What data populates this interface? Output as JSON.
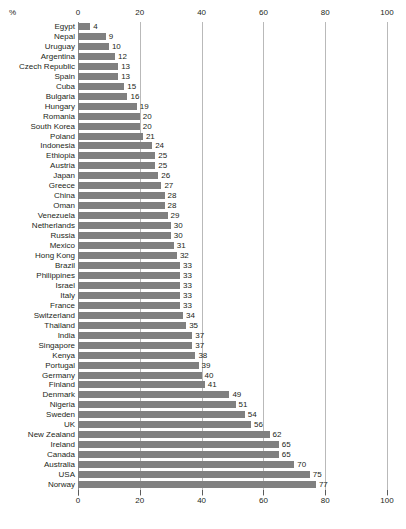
{
  "chart_data": {
    "type": "bar",
    "orientation": "horizontal",
    "title": "",
    "subtitle": "",
    "xlabel": "",
    "ylabel": "",
    "unit_label": "%",
    "xlim": [
      0,
      100
    ],
    "xticks": [
      0,
      20,
      40,
      60,
      80,
      100
    ],
    "xtick_labels": [
      "0",
      "20",
      "40",
      "60",
      "80",
      "100"
    ],
    "grid": true,
    "grid_axis": "x",
    "axis_positions": [
      "top",
      "bottom"
    ],
    "legend": false,
    "legend_position": "none",
    "bar_color": "#808080",
    "gridline_color": "#b9b9b9",
    "text_color": "#231f20",
    "background_color": "#ffffff",
    "show_value_labels": true,
    "sort_order": "ascending",
    "categories": [
      "Egypt",
      "Nepal",
      "Uruguay",
      "Argentina",
      "Czech Republic",
      "Spain",
      "Cuba",
      "Bulgaria",
      "Hungary",
      "Romania",
      "South Korea",
      "Poland",
      "Indonesia",
      "Ethiopia",
      "Austria",
      "Japan",
      "Greece",
      "China",
      "Oman",
      "Venezuela",
      "Netherlands",
      "Russia",
      "Mexico",
      "Hong Kong",
      "Brazil",
      "Philippines",
      "Israel",
      "Italy",
      "France",
      "Switzerland",
      "Thailand",
      "India",
      "Singapore",
      "Kenya",
      "Portugal",
      "Germany",
      "Finland",
      "Denmark",
      "Nigeria",
      "Sweden",
      "UK",
      "New Zealand",
      "Ireland",
      "Canada",
      "Australia",
      "USA",
      "Norway"
    ],
    "values": [
      4,
      9,
      10,
      12,
      13,
      13,
      15,
      16,
      19,
      20,
      20,
      21,
      24,
      25,
      25,
      26,
      27,
      28,
      28,
      29,
      30,
      30,
      31,
      32,
      33,
      33,
      33,
      33,
      33,
      34,
      35,
      37,
      37,
      38,
      39,
      40,
      41,
      49,
      51,
      54,
      56,
      62,
      65,
      65,
      70,
      75,
      77
    ]
  }
}
